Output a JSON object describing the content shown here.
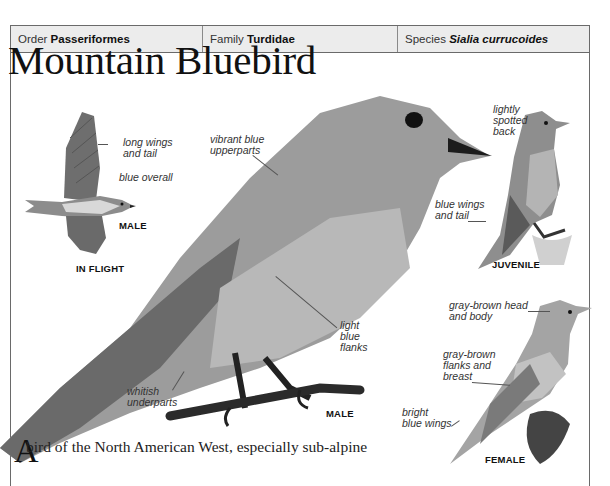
{
  "taxonomy": {
    "order_label": "Order",
    "order_value": "Passeriformes",
    "family_label": "Family",
    "family_value": "Turdidae",
    "species_label": "Species",
    "species_value": "Sialia currucoides"
  },
  "title": "Mountain Bluebird",
  "illustrations": {
    "in_flight": {
      "caption": "IN FLIGHT",
      "sex": "MALE",
      "labels": [
        "long wings\nand tail",
        "blue overall"
      ]
    },
    "main_male": {
      "sex": "MALE",
      "labels": [
        "vibrant blue\nupperparts",
        "light\nblue\nflanks",
        "whitish\nunderparts"
      ]
    },
    "juvenile": {
      "caption": "JUVENILE",
      "labels": [
        "lightly\nspotted\nback",
        "blue wings\nand tail"
      ]
    },
    "female": {
      "caption": "FEMALE",
      "labels": [
        "gray-brown head\nand body",
        "gray-brown\nflanks and\nbreast",
        "bright\nblue wings"
      ]
    }
  },
  "labels": {
    "long_wings_1": "long wings",
    "long_wings_2": "and tail",
    "blue_overall": "blue overall",
    "flight_male": "MALE",
    "in_flight": "IN FLIGHT",
    "vibrant_1": "vibrant blue",
    "vibrant_2": "upperparts",
    "light_1": "light",
    "light_2": "blue",
    "light_3": "flanks",
    "whitish_1": "whitish",
    "whitish_2": "underparts",
    "main_male": "MALE",
    "lightly_1": "lightly",
    "lightly_2": "spotted",
    "lightly_3": "back",
    "bluewings_1": "blue wings",
    "bluewings_2": "and tail",
    "juvenile": "JUVENILE",
    "grayhead_1": "gray-brown head",
    "grayhead_2": "and body",
    "grayflanks_1": "gray-brown",
    "grayflanks_2": "flanks and",
    "grayflanks_3": "breast",
    "bright_1": "bright",
    "bright_2": "blue wings",
    "female": "FEMALE"
  },
  "intro": {
    "drop_cap": "A",
    "text": "bird of the North American West, especially sub-alpine"
  },
  "colors": {
    "frame": "#6a6a6a",
    "taxbar_bg": "#ececec",
    "bird_mid": "#9a9a9a",
    "bird_dark": "#4a4a4a"
  }
}
